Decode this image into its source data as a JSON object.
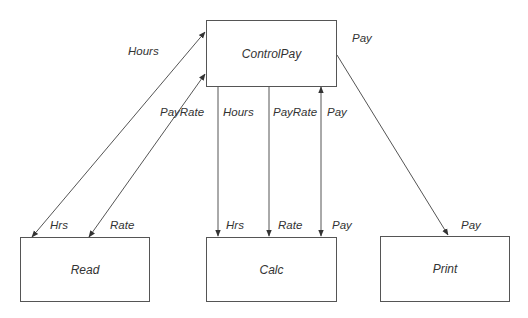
{
  "modules": {
    "controlpay": {
      "label": "ControlPay"
    },
    "read": {
      "label": "Read"
    },
    "calc": {
      "label": "Calc"
    },
    "print": {
      "label": "Print"
    }
  },
  "flows": {
    "hours_top": "Hours",
    "payrate_left": "PayRate",
    "hours_calc_top": "Hours",
    "payrate_calc_top": "PayRate",
    "pay_calc_top": "Pay",
    "pay_print_top": "Pay",
    "hrs_read": "Hrs",
    "rate_read": "Rate",
    "hrs_calc": "Hrs",
    "rate_calc": "Rate",
    "pay_calc": "Pay",
    "pay_print": "Pay"
  },
  "colors": {
    "line": "#555555",
    "text": "#333333"
  }
}
